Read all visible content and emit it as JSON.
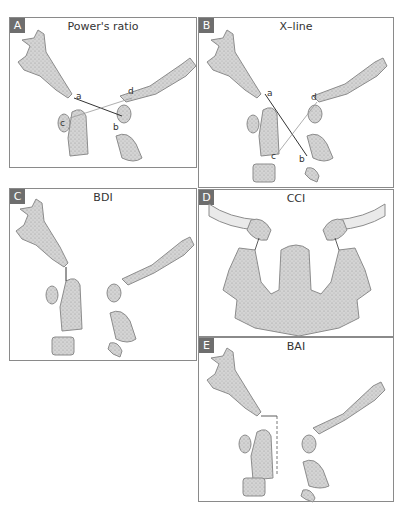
{
  "panels": [
    {
      "id": "A",
      "letter": "A",
      "title": "Power's ratio",
      "points": [
        "a",
        "b",
        "c",
        "d"
      ]
    },
    {
      "id": "B",
      "letter": "B",
      "title": "X–line",
      "points": [
        "a",
        "b",
        "c",
        "d"
      ]
    },
    {
      "id": "C",
      "letter": "C",
      "title": "BDI"
    },
    {
      "id": "D",
      "letter": "D",
      "title": "CCI"
    },
    {
      "id": "E",
      "letter": "E",
      "title": "BAI"
    }
  ],
  "colors": {
    "bone_fill": "#cfcfcf",
    "bone_stroke": "#8c8c8c",
    "label_bg": "#6e6e6e",
    "border": "#8a8a8a"
  }
}
